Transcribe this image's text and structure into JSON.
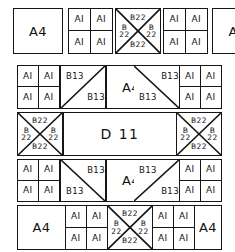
{
  "diagram": {
    "stroke_color": "#161616",
    "background": "#ffffff",
    "labels": {
      "a4": "A4",
      "a1": "AI",
      "b13": "B13",
      "b22": "B22",
      "b22_line1": "B",
      "b22_line2": "22",
      "d11": "D 11"
    },
    "rows": [
      {
        "index": 1,
        "name": "row-1",
        "blocks": [
          {
            "kind": "a4-panel",
            "label": "A4"
          },
          {
            "kind": "a1-quad",
            "labels": [
              "AI",
              "AI",
              "AI",
              "AI"
            ]
          },
          {
            "kind": "b22-cross",
            "labels": {
              "top": "B22",
              "bottom": "B22",
              "left": "B 22",
              "right": "B 22"
            }
          },
          {
            "kind": "a1-quad",
            "labels": [
              "AI",
              "AI",
              "AI",
              "AI"
            ]
          },
          {
            "kind": "a4-panel",
            "label": "A4"
          }
        ]
      },
      {
        "index": 2,
        "name": "row-2",
        "blocks": [
          {
            "kind": "a1-quad",
            "labels": [
              "AI",
              "AI",
              "AI",
              "AI"
            ]
          },
          {
            "kind": "b13-split",
            "diagonal": "bl-tr",
            "labels": [
              "B13",
              "B13"
            ]
          },
          {
            "kind": "a4-panel",
            "label": "A4"
          },
          {
            "kind": "b13-split",
            "diagonal": "tl-br",
            "labels": [
              "B13",
              "B13"
            ]
          },
          {
            "kind": "a1-quad",
            "labels": [
              "AI",
              "AI",
              "AI",
              "AI"
            ]
          }
        ]
      },
      {
        "index": 3,
        "name": "row-3",
        "blocks": [
          {
            "kind": "b22-cross",
            "labels": {
              "top": "B22",
              "bottom": "B22",
              "left": "B 22",
              "right": "B 22"
            }
          },
          {
            "kind": "d11-panel",
            "label": "D 11"
          },
          {
            "kind": "b22-cross",
            "labels": {
              "top": "B22",
              "bottom": "B22",
              "left": "B 22",
              "right": "B 22"
            }
          }
        ]
      },
      {
        "index": 4,
        "name": "row-4",
        "blocks": [
          {
            "kind": "a1-quad",
            "labels": [
              "AI",
              "AI",
              "AI",
              "AI"
            ]
          },
          {
            "kind": "b13-split",
            "diagonal": "tl-br",
            "labels": [
              "B13",
              "B13"
            ]
          },
          {
            "kind": "a4-panel",
            "label": "A4"
          },
          {
            "kind": "b13-split",
            "diagonal": "bl-tr",
            "labels": [
              "B13",
              "B13"
            ]
          },
          {
            "kind": "a1-quad",
            "labels": [
              "AI",
              "AI",
              "AI",
              "AI"
            ]
          }
        ]
      },
      {
        "index": 5,
        "name": "row-5",
        "blocks": [
          {
            "kind": "a4-panel",
            "label": "A4"
          },
          {
            "kind": "a1-quad",
            "labels": [
              "AI",
              "AI",
              "AI",
              "AI"
            ]
          },
          {
            "kind": "b22-cross",
            "labels": {
              "top": "B22",
              "bottom": "B22",
              "left": "B 22",
              "right": "B 22"
            }
          },
          {
            "kind": "a1-quad",
            "labels": [
              "AI",
              "AI",
              "AI",
              "AI"
            ]
          },
          {
            "kind": "a4-panel",
            "label": "A4"
          }
        ]
      }
    ]
  }
}
